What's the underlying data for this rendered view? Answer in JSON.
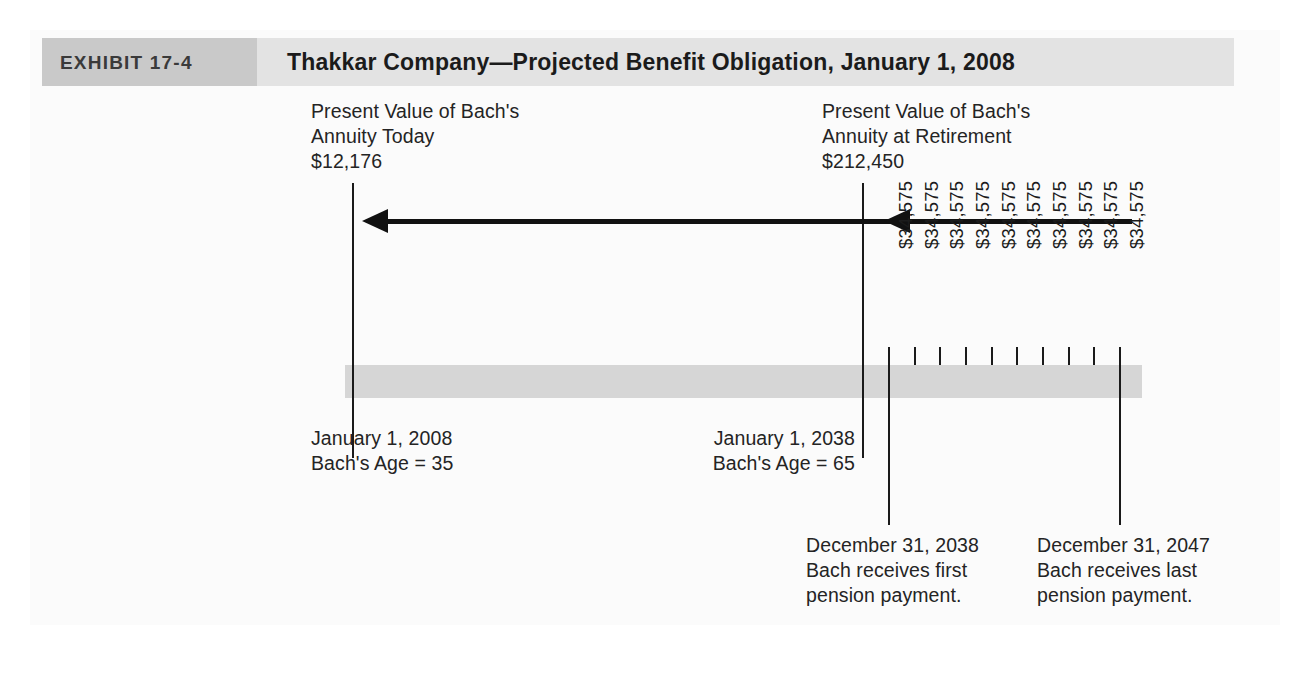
{
  "exhibit": {
    "tag": "EXHIBIT 17-4",
    "title": "Thakkar Company—Projected Benefit Obligation, January 1, 2008"
  },
  "annotations": {
    "pv_today": "Present Value of Bach's\nAnnuity Today\n$12,176",
    "pv_retirement": "Present Value of Bach's\nAnnuity at Retirement\n$212,450",
    "date_start": "January 1, 2008\nBach's Age = 35",
    "date_retirement": "January 1, 2038\nBach's Age = 65",
    "first_payment": "December 31, 2038\nBach receives first\npension payment.",
    "last_payment": "December 31, 2047\nBach receives last\npension payment."
  },
  "chart_data": {
    "type": "timeline",
    "title": "Thakkar Company—Projected Benefit Obligation, January 1, 2008",
    "milestones": [
      {
        "label": "January 1, 2008",
        "detail": "Bach's Age = 35",
        "value_label": "Present Value of Bach's Annuity Today",
        "value": "$12,176",
        "x": 352
      },
      {
        "label": "January 1, 2038",
        "detail": "Bach's Age = 65",
        "value_label": "Present Value of Bach's Annuity at Retirement",
        "value": "$212,450",
        "x": 862
      },
      {
        "label": "December 31, 2038",
        "detail": "Bach receives first pension payment.",
        "x": 888
      },
      {
        "label": "December 31, 2047",
        "detail": "Bach receives last pension payment.",
        "x": 1119
      }
    ],
    "payments": [
      "$34,575",
      "$34,575",
      "$34,575",
      "$34,575",
      "$34,575",
      "$34,575",
      "$34,575",
      "$34,575",
      "$34,575",
      "$34,575"
    ],
    "payment_count": 10,
    "payment_amount": 34575,
    "pv_at_retirement": 212450,
    "pv_today": 12176,
    "arrows": [
      {
        "name": "discount-to-today",
        "from_x": 1132,
        "to_x": 362,
        "direction": "left"
      },
      {
        "name": "discount-to-retirement",
        "from_x": 1132,
        "to_x": 884,
        "direction": "left"
      }
    ],
    "colors": {
      "ink": "#111111",
      "band": "#d6d6d6",
      "header_band": "#e3e3e3",
      "exhibit_tab": "#c9c9c9",
      "paper": "#fbfbfb"
    }
  }
}
